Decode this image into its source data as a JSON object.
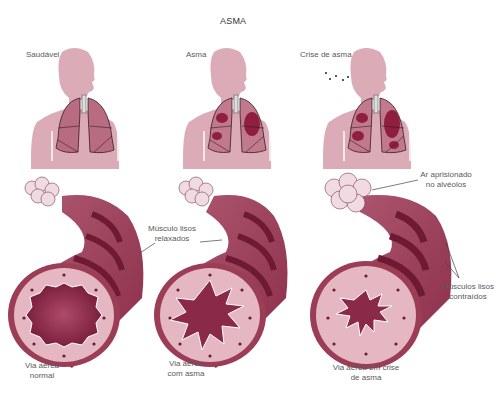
{
  "title": "ASMA",
  "colors": {
    "body_silhouette": "#d9a9b6",
    "lung_fill": "#b5697f",
    "lung_outline": "#3a1a22",
    "inflammation": "#8e1f3f",
    "airway_outer": "#9c3d58",
    "airway_band": "#6e1a33",
    "airway_wall": "#e4b7c3",
    "lumen": "#8a2a48",
    "alveoli": "#f1dbe2",
    "leader_line": "#444444"
  },
  "panels": [
    {
      "id": "healthy",
      "label": "Saudável",
      "airway_label": [
        "Via aérea",
        "normal"
      ]
    },
    {
      "id": "asthma",
      "label": "Asma",
      "airway_label": [
        "Via aérea",
        "com asma"
      ]
    },
    {
      "id": "attack",
      "label": "Crise de asma",
      "airway_label": [
        "Via aérea em crise",
        "de asma"
      ]
    }
  ],
  "annotations": {
    "relaxed_muscle": [
      "Músculo lisos",
      "relaxados"
    ],
    "trapped_air": [
      "Ar aprisionado",
      "no alvéolos"
    ],
    "contracted_muscle": [
      "Músculos lisos",
      "contraídos"
    ]
  }
}
